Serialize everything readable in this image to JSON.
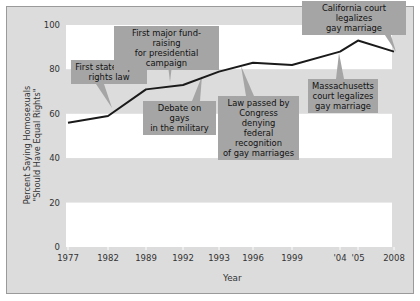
{
  "chart_data": {
    "type": "line",
    "title": "",
    "xlabel": "Year",
    "ylabel": "Percent Saying Homosexuals \"Should Have Equal Rights\"",
    "ylabel_lines": [
      "Percent Saying Homosexuals",
      "\"Should Have Equal Rights\""
    ],
    "categories": [
      "1977",
      "1982",
      "1989",
      "1992",
      "1993",
      "1996",
      "1999",
      "'04",
      "'05",
      "2008"
    ],
    "values": [
      56,
      59,
      71,
      73,
      79,
      83,
      82,
      88,
      93,
      88
    ],
    "ylim": [
      0,
      100
    ],
    "yticks": [
      0,
      20,
      40,
      60,
      80,
      100
    ],
    "grid": "alternating horizontal bands",
    "legend": null,
    "annotations": [
      {
        "lines": [
          "First state equal",
          "rights law"
        ],
        "year": "1982"
      },
      {
        "lines": [
          "First major fund-raising",
          "for presidential campaign"
        ],
        "year": "1992"
      },
      {
        "lines": [
          "Debate on gays",
          "in the military"
        ],
        "year": "1993"
      },
      {
        "lines": [
          "Law passed by",
          "Congress denying",
          "federal recognition",
          "of gay marriages"
        ],
        "year": "1996"
      },
      {
        "lines": [
          "Massachusetts",
          "court legalizes",
          "gay marriage"
        ],
        "year": "'04"
      },
      {
        "lines": [
          "California court legalizes",
          "gay marriage"
        ],
        "year": "2008"
      }
    ]
  },
  "colors": {
    "line": "#1a1a1a",
    "band": "#dcdcdc",
    "plot": "#ffffff",
    "callout": "#a5a5a5"
  }
}
